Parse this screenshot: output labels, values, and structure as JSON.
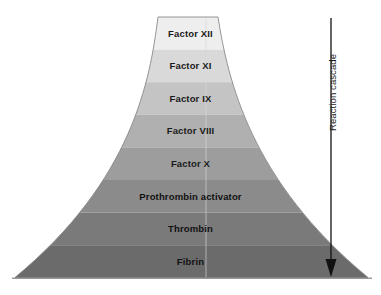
{
  "diagram": {
    "background_color": "#ffffff",
    "bands": [
      {
        "label": "Factor XII",
        "color": "#eeeeee",
        "order": 1
      },
      {
        "label": "Factor XI",
        "color": "#d9d9d9",
        "order": 2
      },
      {
        "label": "Factor IX",
        "color": "#c4c4c4",
        "order": 3
      },
      {
        "label": "Factor VIII",
        "color": "#b0b0b0",
        "order": 4
      },
      {
        "label": "Factor X",
        "color": "#9d9d9d",
        "order": 5
      },
      {
        "label": "Prothrombin activator",
        "color": "#8b8b8b",
        "order": 6
      },
      {
        "label": "Thrombin",
        "color": "#7a7a7a",
        "order": 7
      },
      {
        "label": "Fibrin",
        "color": "#6b6b6b",
        "order": 8
      }
    ],
    "annotation": {
      "arrow_label": "Reaction cascade",
      "arrow_direction": "down",
      "arrow_color": "#111111"
    },
    "outline_color": "#8a8a8a",
    "baseline_color": "#6a6a6a",
    "highlight_line_color": "#d8d8d8"
  },
  "chart_data": {
    "type": "diagram",
    "title": "Reaction cascade",
    "categories": [
      "Factor XII",
      "Factor XI",
      "Factor IX",
      "Factor VIII",
      "Factor X",
      "Prothrombin activator",
      "Thrombin",
      "Fibrin"
    ],
    "values": [
      1,
      2,
      3,
      4,
      5,
      6,
      7,
      8
    ],
    "xlabel": "",
    "ylabel": "Reaction cascade"
  }
}
